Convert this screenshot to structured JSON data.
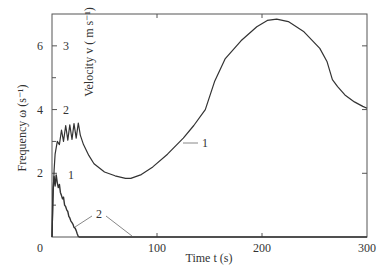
{
  "chart_data": {
    "type": "line",
    "title": "",
    "xlabel": "Time t (s)",
    "ylabel_left": "Frequency ω (s⁻¹)",
    "ylabel_inner": "Velocity v ( m s⁻¹)",
    "xlim": [
      0,
      300
    ],
    "ylim_left": [
      0,
      7
    ],
    "ylim_velocity": [
      0,
      3.5
    ],
    "x_ticks": [
      0,
      100,
      200,
      300
    ],
    "x_tick_labels": [
      "0",
      "100",
      "200",
      "300"
    ],
    "y_left_ticks": [
      2,
      4,
      6
    ],
    "y_left_tick_labels": [
      "2",
      "4",
      "6"
    ],
    "y_velocity_ticks": [
      2,
      3
    ],
    "y_velocity_tick_labels": [
      "2",
      "3"
    ],
    "grid": false,
    "series": [
      {
        "name": "Velocity",
        "label": "1",
        "axis": "velocity",
        "x": [
          0,
          1,
          2,
          3,
          5,
          7,
          9,
          11,
          13,
          15,
          17,
          19,
          21,
          23,
          25,
          27,
          30,
          35,
          40,
          50,
          60,
          70,
          75,
          85,
          96,
          110,
          125,
          135,
          146,
          155,
          165,
          180,
          195,
          205,
          214,
          225,
          240,
          255,
          262,
          267,
          272,
          279,
          288,
          296,
          300
        ],
        "values": [
          0,
          0.6,
          1.05,
          1.3,
          1.5,
          1.45,
          1.68,
          1.5,
          1.75,
          1.52,
          1.76,
          1.53,
          1.78,
          1.55,
          1.79,
          1.6,
          1.45,
          1.28,
          1.15,
          1.02,
          0.96,
          0.92,
          0.92,
          0.98,
          1.1,
          1.3,
          1.55,
          1.75,
          2.0,
          2.45,
          2.8,
          3.08,
          3.3,
          3.4,
          3.42,
          3.38,
          3.22,
          2.96,
          2.75,
          2.47,
          2.36,
          2.23,
          2.12,
          2.05,
          2.02
        ]
      },
      {
        "name": "Frequency",
        "label": "2",
        "axis": "left",
        "x": [
          0,
          1,
          2,
          3,
          4,
          5,
          6,
          7,
          8,
          9,
          10,
          11,
          12,
          13,
          14,
          15,
          16,
          17,
          18,
          19,
          20,
          21,
          22,
          23,
          24,
          25,
          26,
          30,
          50,
          100,
          200,
          300
        ],
        "values": [
          0,
          1.5,
          1.9,
          1.6,
          1.95,
          1.7,
          1.55,
          1.65,
          1.4,
          1.3,
          1.2,
          1.25,
          1.0,
          0.95,
          0.85,
          0.8,
          0.65,
          0.6,
          0.5,
          0.45,
          0.4,
          0.3,
          0.28,
          0.2,
          0.1,
          0.02,
          0,
          0,
          0,
          0,
          0,
          0
        ]
      }
    ],
    "annotations": [
      {
        "text": "1",
        "target": "Velocity",
        "leader_at_x": 148
      },
      {
        "text": "1",
        "target": "Frequency",
        "near_x": 15
      },
      {
        "text": "2",
        "target": "Frequency",
        "leader_at_x": 22
      },
      {
        "text": "2",
        "target": "Frequency",
        "leader_at_x": 76
      }
    ]
  }
}
